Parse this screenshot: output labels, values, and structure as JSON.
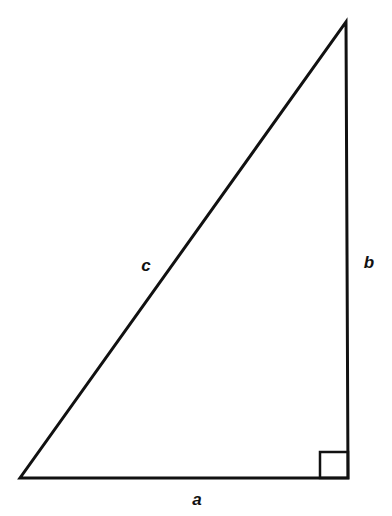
{
  "diagram": {
    "type": "right-triangle",
    "vertices": {
      "left": [
        20,
        478
      ],
      "right_angle": [
        348,
        478
      ],
      "apex": [
        346,
        22
      ]
    },
    "right_angle_marker": {
      "x": 320,
      "y": 452,
      "size": 28
    },
    "stroke_color": "#111111",
    "stroke_width": 3,
    "labels": {
      "hypotenuse": {
        "text": "c",
        "x": 146,
        "y": 265
      },
      "vertical_leg": {
        "text": "b",
        "x": 369,
        "y": 262
      },
      "horizontal_leg": {
        "text": "a",
        "x": 197,
        "y": 499
      }
    }
  }
}
